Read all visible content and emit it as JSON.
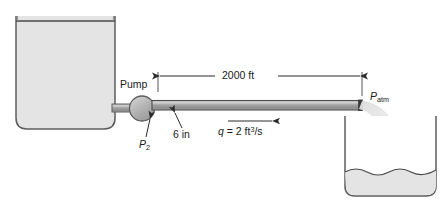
{
  "figure": {
    "labels": {
      "pump": "Pump",
      "length": "2000 ft",
      "diameter": "6 in",
      "pressure_outlet": "P",
      "pressure_outlet_sub": "2",
      "pressure_atm": "P",
      "pressure_atm_sub": "atm",
      "flow_symbol": "q",
      "flow_equals": "= 2 ft",
      "flow_exponent": "3",
      "flow_per_second": "/s"
    },
    "values": {
      "pipe_length_ft": 2000,
      "pipe_diameter_in": 6,
      "flow_rate_ft3_s": 2
    },
    "colors": {
      "water": "#e4e4e4",
      "pipe": "#9a9a9a",
      "outline": "#4a4a4a",
      "jet": "#e8e8e8",
      "text": "#1a1a1a"
    },
    "elements": {
      "supply_tank": "open rectangular reservoir filled with water",
      "pump": "circular pump symbol at tank outlet",
      "pipe": "horizontal discharge pipe",
      "jet": "free jet of water discharging to atmosphere",
      "receiving_tank": "open tank with wavy water surface"
    }
  }
}
